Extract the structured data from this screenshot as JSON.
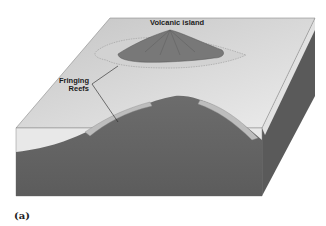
{
  "figure": {
    "caption": "(a)",
    "labels": {
      "island": "Volcanic island",
      "reef_line1": "Fringing",
      "reef_line2": "Reefs"
    },
    "colors": {
      "sea_surface": "#dcdcdc",
      "water_cross_section": "#e6e6e6",
      "seafloor": "#6e6e6e",
      "island": "#7a7a7a",
      "reef": "#c8c8c8",
      "side_face": "#5e5e5e"
    }
  }
}
